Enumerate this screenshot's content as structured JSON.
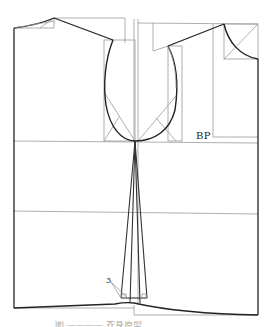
{
  "diagram": {
    "type": "garment-pattern-draft",
    "labels": {
      "bust_point": "BP",
      "dart_intake": "3"
    },
    "caption": "图 ———— 衣身原型"
  },
  "colors": {
    "outline": "#222222",
    "guide": "#9a9a9a",
    "background": "#ffffff"
  },
  "panels": [
    {
      "name": "back",
      "x_range": [
        13,
        135
      ],
      "shoulder_y": [
        14,
        37
      ],
      "hem_y": 308
    },
    {
      "name": "front",
      "x_range": [
        135,
        258
      ],
      "shoulder_y": [
        23,
        56
      ],
      "hem_y": 315
    }
  ],
  "reference_lines": [
    {
      "name": "chest-line",
      "y": 141
    },
    {
      "name": "waist-line",
      "y": 211
    }
  ]
}
